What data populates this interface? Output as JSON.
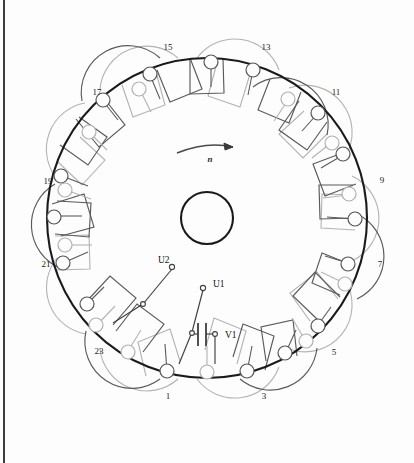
{
  "diagram": {
    "type": "motor-stator-winding",
    "slot_count": 24,
    "rotation_label": "n",
    "colors": {
      "stator_ring": "#1a1a1a",
      "phase_main": "#4a4a4a",
      "phase_aux": "#b0b0b0",
      "slot_circle": "#555555",
      "slot_circle_aux": "#aaaaaa",
      "text": "#111111",
      "background": "#fdfdfd",
      "rule": "#3b3b3b"
    },
    "geometry": {
      "center_x": 207,
      "center_y": 218,
      "stator_radius": 160,
      "slot_radius": 150,
      "shaft_radius": 26
    }
  },
  "slot_numbers": [
    {
      "label": "1",
      "x": 168,
      "y": 399
    },
    {
      "label": "3",
      "x": 264,
      "y": 399
    },
    {
      "label": "5",
      "x": 334,
      "y": 355
    },
    {
      "label": "7",
      "x": 380,
      "y": 267
    },
    {
      "label": "9",
      "x": 382,
      "y": 183
    },
    {
      "label": "11",
      "x": 336,
      "y": 95
    },
    {
      "label": "13",
      "x": 266,
      "y": 50
    },
    {
      "label": "15",
      "x": 168,
      "y": 50
    },
    {
      "label": "17",
      "x": 97,
      "y": 95
    },
    {
      "label": "19",
      "x": 48,
      "y": 184
    },
    {
      "label": "21",
      "x": 46,
      "y": 267
    },
    {
      "label": "23",
      "x": 99,
      "y": 354
    }
  ],
  "terminals": [
    {
      "id": "U1",
      "label": "U1",
      "label_x": 213,
      "label_y": 287,
      "node_x": 203,
      "node_y": 288
    },
    {
      "id": "U2",
      "label": "U2",
      "label_x": 165,
      "label_y": 263,
      "node_x": 172,
      "node_y": 267
    },
    {
      "id": "V1",
      "label": "V1",
      "label_x": 225,
      "label_y": 337,
      "node_x": 214,
      "node_y": 334
    }
  ],
  "components": [
    {
      "id": "C1",
      "type": "capacitor",
      "x": 200,
      "y": 335,
      "orientation": "horizontal"
    }
  ],
  "rotation_arrow": {
    "label": "n",
    "label_x": 210,
    "label_y": 160,
    "direction": "clockwise"
  }
}
